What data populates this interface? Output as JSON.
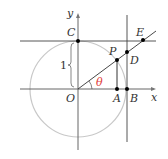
{
  "diagram": {
    "labels": {
      "y_axis": "y",
      "x_axis": "x",
      "origin": "O",
      "C": "C",
      "P": "P",
      "D": "D",
      "E": "E",
      "A": "A",
      "B": "B",
      "radius": "1",
      "angle": "θ"
    },
    "colors": {
      "circle": "#c8c8c8",
      "line": "#333333",
      "angle": "#e0403a",
      "point": "#000000"
    }
  }
}
